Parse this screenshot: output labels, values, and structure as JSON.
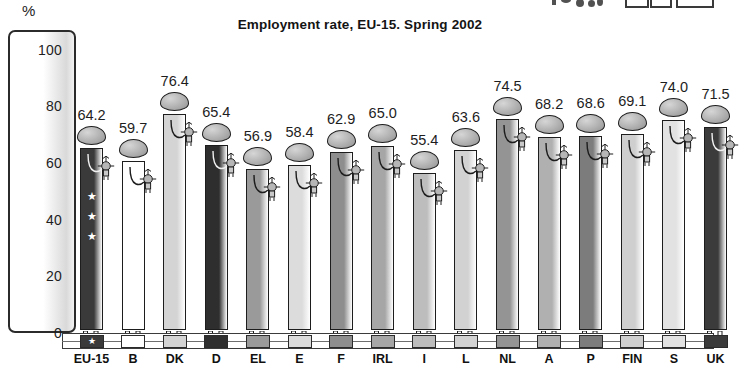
{
  "page": {
    "unit_label": "%",
    "title": "Employment rate, EU-15. Spring 2002"
  },
  "chart_data": {
    "type": "bar",
    "title": "Employment rate, EU-15. Spring 2002",
    "xlabel": "",
    "ylabel": "%",
    "ylim": [
      0,
      110
    ],
    "yticks": [
      0,
      20,
      40,
      60,
      80,
      100
    ],
    "grid": false,
    "legend_position": "bottom",
    "categories": [
      "EU-15",
      "B",
      "DK",
      "D",
      "EL",
      "E",
      "F",
      "IRL",
      "I",
      "L",
      "NL",
      "A",
      "P",
      "FIN",
      "S",
      "UK"
    ],
    "values": [
      64.2,
      59.7,
      76.4,
      65.4,
      56.9,
      58.4,
      62.9,
      65.0,
      55.4,
      63.6,
      74.5,
      68.2,
      68.6,
      69.1,
      74.0,
      71.5
    ],
    "series": [
      {
        "name": "Employment rate",
        "values": [
          64.2,
          59.7,
          76.4,
          65.4,
          56.9,
          58.4,
          62.9,
          65.0,
          55.4,
          63.6,
          74.5,
          68.2,
          68.6,
          69.1,
          74.0,
          71.5
        ]
      }
    ],
    "colors": [
      "#3a3a3a",
      "#ffffff",
      "#d4d4d4",
      "#2e2e2e",
      "#9a9a9a",
      "#dcdcdc",
      "#8e8e8e",
      "#a6a6a6",
      "#bdbdbd",
      "#d2d2d2",
      "#949494",
      "#b0b0b0",
      "#7c7c7c",
      "#cfcfcf",
      "#e2e2e2",
      "#3b3b3b"
    ]
  },
  "bars": [
    {
      "code": "EU-15",
      "value": 64.2,
      "value_label": "64.2",
      "color": "#3a3a3a",
      "stars": 3
    },
    {
      "code": "B",
      "value": 59.7,
      "value_label": "59.7",
      "color": "#ffffff",
      "stars": 0
    },
    {
      "code": "DK",
      "value": 76.4,
      "value_label": "76.4",
      "color": "#d4d4d4",
      "stars": 0
    },
    {
      "code": "D",
      "value": 65.4,
      "value_label": "65.4",
      "color": "#2e2e2e",
      "stars": 0
    },
    {
      "code": "EL",
      "value": 56.9,
      "value_label": "56.9",
      "color": "#9a9a9a",
      "stars": 0
    },
    {
      "code": "E",
      "value": 58.4,
      "value_label": "58.4",
      "color": "#dcdcdc",
      "stars": 0
    },
    {
      "code": "F",
      "value": 62.9,
      "value_label": "62.9",
      "color": "#8e8e8e",
      "stars": 0
    },
    {
      "code": "IRL",
      "value": 65.0,
      "value_label": "65.0",
      "color": "#a6a6a6",
      "stars": 0
    },
    {
      "code": "I",
      "value": 55.4,
      "value_label": "55.4",
      "color": "#bdbdbd",
      "stars": 0
    },
    {
      "code": "L",
      "value": 63.6,
      "value_label": "63.6",
      "color": "#d2d2d2",
      "stars": 0
    },
    {
      "code": "NL",
      "value": 74.5,
      "value_label": "74.5",
      "color": "#949494",
      "stars": 0
    },
    {
      "code": "A",
      "value": 68.2,
      "value_label": "68.2",
      "color": "#b0b0b0",
      "stars": 0
    },
    {
      "code": "P",
      "value": 68.6,
      "value_label": "68.6",
      "color": "#7c7c7c",
      "stars": 0
    },
    {
      "code": "FIN",
      "value": 69.1,
      "value_label": "69.1",
      "color": "#cfcfcf",
      "stars": 0
    },
    {
      "code": "S",
      "value": 74.0,
      "value_label": "74.0",
      "color": "#e2e2e2",
      "stars": 0
    },
    {
      "code": "UK",
      "value": 71.5,
      "value_label": "71.5",
      "color": "#3b3b3b",
      "stars": 0
    }
  ],
  "yaxis": {
    "ticks": [
      "100",
      "80",
      "60",
      "40",
      "20",
      "0"
    ]
  }
}
